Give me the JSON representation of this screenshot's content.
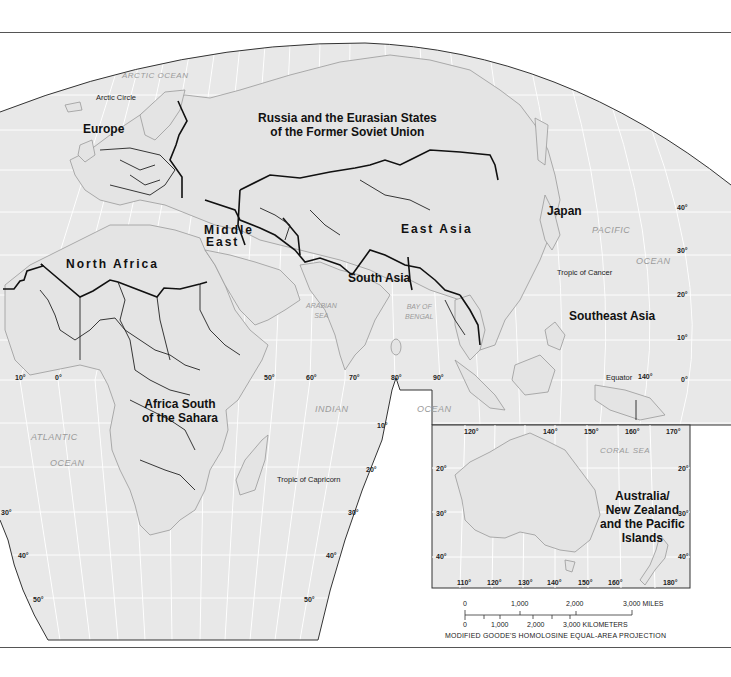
{
  "map": {
    "projection_note": "MODIFIED GOODE'S HOMOLOSINE EQUAL-AREA PROJECTION",
    "colors": {
      "land_sea_fill": "#e8e8e8",
      "graticule": "#ffffff",
      "coastline": "#9a9a9a",
      "region_border": "#111111",
      "frame": "#555555"
    },
    "regions": {
      "europe": "Europe",
      "russia_line1": "Russia and the Eurasian States",
      "russia_line2": "of the Former Soviet Union",
      "middle_east_line1": "Middle",
      "middle_east_line2": "East",
      "north_africa": "North Africa",
      "east_asia": "East Asia",
      "south_asia": "South Asia",
      "japan": "Japan",
      "southeast_asia": "Southeast Asia",
      "africa_south_line1": "Africa South",
      "africa_south_line2": "of the Sahara",
      "australia_line1": "Australia/",
      "australia_line2": "New Zealand",
      "australia_line3": "and the Pacific",
      "australia_line4": "Islands"
    },
    "water_bodies": {
      "arctic_ocean": "ARCTIC OCEAN",
      "pacific": "PACIFIC",
      "pacific_ocean": "OCEAN",
      "arabian_sea_line1": "ARABIAN",
      "arabian_sea_line2": "SEA",
      "bay_of_bengal_line1": "BAY OF",
      "bay_of_bengal_line2": "BENGAL",
      "indian": "INDIAN",
      "indian_ocean": "OCEAN",
      "atlantic": "ATLANTIC",
      "atlantic_ocean": "OCEAN",
      "coral_sea": "CORAL SEA"
    },
    "reference_lines": {
      "arctic_circle": "Arctic Circle",
      "tropic_of_cancer": "Tropic of Cancer",
      "equator": "Equator",
      "tropic_of_capricorn": "Tropic of Capricorn"
    },
    "longitude_labels": {
      "w10": "10°",
      "zero": "0°",
      "e50": "50°",
      "e60": "60°",
      "e70": "70°",
      "e80": "80°",
      "e90": "90°",
      "e140": "140°"
    },
    "latitude_labels_right": {
      "n40": "40°",
      "n30": "30°",
      "n20": "20°",
      "n10": "10°",
      "eq": "0°"
    },
    "latitude_labels_south": {
      "s10": "10°",
      "s20": "20°",
      "s30_right": "30°",
      "s30_left": "30°",
      "s40_left": "40°",
      "s40_right": "40°",
      "s50_left": "50°",
      "s50_right": "50°"
    },
    "inset": {
      "top_longitudes": [
        "120°",
        "140°",
        "150°",
        "160°",
        "170°"
      ],
      "bottom_longitudes": [
        "110°",
        "120°",
        "130°",
        "140°",
        "150°",
        "160°",
        "180°"
      ],
      "left_latitudes": [
        "20°",
        "30°",
        "40°"
      ],
      "right_latitudes": [
        "20°",
        "30°",
        "40°"
      ]
    },
    "scale_bar": {
      "miles_ticks": [
        "0",
        "1,000",
        "2,000",
        "3,000 MILES"
      ],
      "km_ticks": [
        "0",
        "1,000",
        "2,000",
        "3,000 KILOMETERS"
      ]
    }
  }
}
